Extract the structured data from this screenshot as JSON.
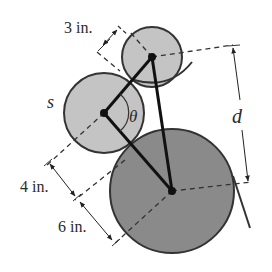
{
  "figure": {
    "type": "gear/pulley linkage diagram",
    "labels": {
      "small_radius": "3 in.",
      "middle_radius": "4 in.",
      "large_radius": "6 in.",
      "middle_arc": "s",
      "angle": "θ",
      "distance": "d"
    },
    "colors": {
      "small_fill": "#c4c4c4",
      "middle_fill": "#c4c4c4",
      "large_fill": "#8a8a8a",
      "stroke": "#333333",
      "link": "#111111",
      "background": "#ffffff"
    },
    "circles": [
      {
        "name": "small",
        "cx": 152,
        "cy": 57,
        "r": 30
      },
      {
        "name": "middle",
        "cx": 104,
        "cy": 113,
        "r": 40
      },
      {
        "name": "large",
        "cx": 172,
        "cy": 191,
        "r": 62
      }
    ]
  }
}
